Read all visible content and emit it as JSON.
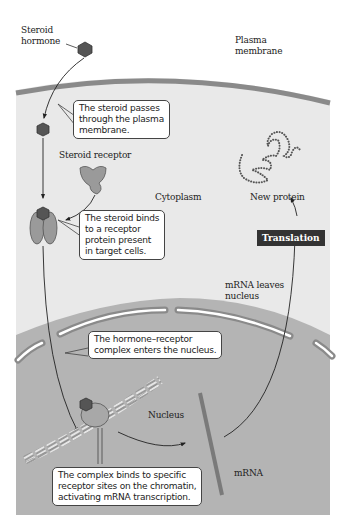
{
  "figure": {
    "labels": {
      "steroid_hormone": "Steroid\nhormone",
      "plasma_membrane": "Plasma\nmembrane",
      "steroid_receptor": "Steroid receptor",
      "cytoplasm": "Cytoplasm",
      "new_protein": "New protein",
      "translation": "Translation",
      "mrna_leaves_nucleus": "mRNA leaves\nnucleus",
      "nucleus": "Nucleus",
      "mrna": "mRNA"
    },
    "callouts": [
      {
        "step": 1,
        "text": "The steroid passes\nthrough the plasma\nmembrane."
      },
      {
        "step": 2,
        "text": "The steroid binds\nto a receptor\nprotein present\nin target cells."
      },
      {
        "step": 3,
        "text": "The hormone–receptor\ncomplex enters the nucleus."
      },
      {
        "step": 4,
        "text": "The complex binds to specific\nreceptor sites on the chromatin,\nactivating mRNA transcription."
      }
    ],
    "colors": {
      "cytoplasm": "#e9e9e9",
      "membrane": "#8a8a8a",
      "nucleus": "#b4b4b4",
      "hormone": "#555555",
      "receptor": "#9a9a9a",
      "translation_box": "#333333",
      "mrna_strand": "#7a7a7a"
    }
  }
}
